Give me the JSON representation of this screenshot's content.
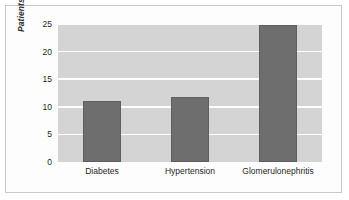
{
  "chart_data": {
    "type": "bar",
    "title": "",
    "xlabel": "",
    "ylabel": "Patients with end stage renal failure (%)",
    "categories": [
      "Diabetes",
      "Hypertension",
      "Glomerulonephritis"
    ],
    "values": [
      11.0,
      11.8,
      24.8
    ],
    "ylim": [
      0,
      25
    ],
    "yticks": [
      0,
      5,
      10,
      15,
      20,
      25
    ],
    "ytick_labels": [
      "0",
      "5",
      "10",
      "15",
      "20",
      "25"
    ],
    "grid": true,
    "legend": null,
    "colors": {
      "bar": "#6e6e6e",
      "bar_edge": "#5f5f5f",
      "plot_background": "#d4d4d4",
      "gridline": "#fdfdfd",
      "figure_background": "#ffffff",
      "frame_border": "#c9c9c9",
      "text": "#1f1f1f"
    }
  }
}
